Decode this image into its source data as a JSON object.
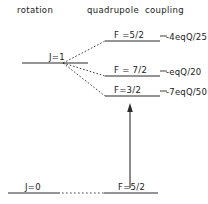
{
  "figure": {
    "type": "energy-level-diagram",
    "width": 208,
    "height": 204,
    "background_color": "#ffffff",
    "line_color": "#2b2b2b",
    "text_color": "#1a1a1a"
  },
  "headers": {
    "left": "rotation",
    "middle": "quadrupole",
    "right": "coupling"
  },
  "rotational_levels": [
    {
      "label": "J=1",
      "y": 63
    },
    {
      "label": "J=0",
      "y": 193
    }
  ],
  "hyperfine_levels": [
    {
      "f_label": "F =5/2",
      "energy_label": "-4eqQ/25",
      "y": 41
    },
    {
      "f_label": "F = 7/2",
      "energy_label": "-eqQ/20",
      "y": 76
    },
    {
      "f_label": "F=3/2",
      "energy_label": "-7eqQ/50",
      "y": 96
    }
  ],
  "ground_state": {
    "rotation_label": "J=0",
    "hyperfine_label": "F=5/2"
  },
  "transition_arrow": {
    "direction": "up",
    "x": 130,
    "from_y": 188,
    "to_y": 104
  }
}
